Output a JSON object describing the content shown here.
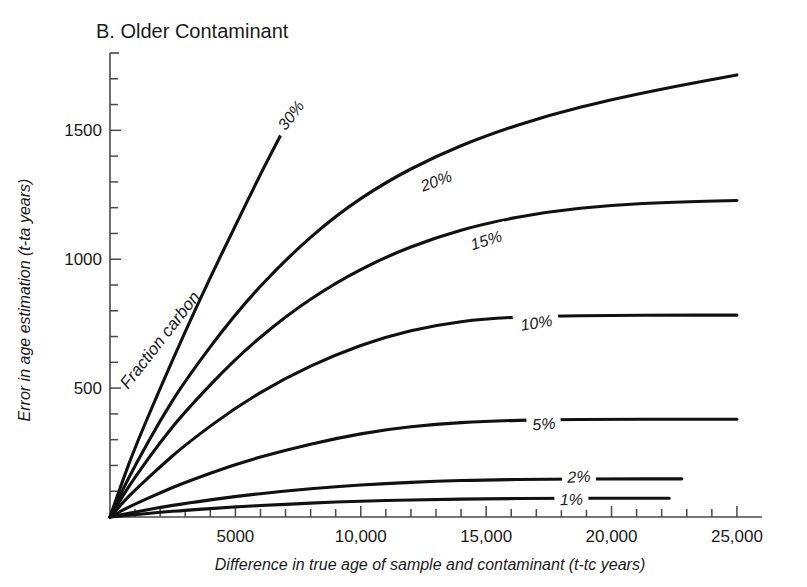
{
  "figure": {
    "panel_label": "B. Older Contaminant",
    "background_color": "#ffffff",
    "curve_color": "#111111",
    "axis_color": "#4a4a4a"
  },
  "chart_data": {
    "type": "line",
    "title": "B. Older Contaminant",
    "xlabel": "Difference in true age of sample and contaminant (t-tc years)",
    "ylabel": "Error in age estimation (t-ta years)",
    "xlim": [
      0,
      26000
    ],
    "ylim": [
      0,
      1800
    ],
    "grid": false,
    "legend": "inline-curve-labels",
    "annotation": "Fraction carbon",
    "x_ticks_major": [
      5000,
      10000,
      15000,
      20000,
      25000
    ],
    "x_tick_labels": [
      "5000",
      "10,000",
      "15,000",
      "20,000",
      "25,000"
    ],
    "x_tick_minor_step": 1000,
    "y_ticks_major": [
      500,
      1000,
      1500
    ],
    "y_tick_labels": [
      "500",
      "1000",
      "1500"
    ],
    "y_tick_minor_step": 100,
    "series": [
      {
        "name": "30%",
        "label": "30%",
        "label_x": 7200,
        "label_y": 1560,
        "label_rotation": -52,
        "x": [
          0,
          500,
          1000,
          2000,
          3000,
          4000,
          5000,
          6000,
          6800
        ],
        "values": [
          0,
          140,
          270,
          500,
          720,
          930,
          1130,
          1330,
          1480
        ]
      },
      {
        "name": "20%",
        "label": "20%",
        "label_x": 13000,
        "label_y": 1305,
        "label_rotation": -20,
        "x": [
          0,
          500,
          1000,
          2000,
          3000,
          5000,
          7000,
          9000,
          11000,
          13000,
          15000,
          17500,
          20000,
          22500,
          25000
        ],
        "values": [
          0,
          105,
          200,
          375,
          530,
          790,
          1000,
          1170,
          1300,
          1400,
          1480,
          1560,
          1620,
          1670,
          1715
        ]
      },
      {
        "name": "15%",
        "label": "15%",
        "label_x": 15000,
        "label_y": 1075,
        "label_rotation": -17,
        "x": [
          0,
          500,
          1000,
          2000,
          3000,
          5000,
          7000,
          9000,
          11000,
          13000,
          15000,
          17500,
          20000,
          22500,
          25000
        ],
        "values": [
          0,
          80,
          155,
          290,
          410,
          615,
          780,
          910,
          1010,
          1085,
          1140,
          1185,
          1210,
          1222,
          1228
        ]
      },
      {
        "name": "10%",
        "label": "10%",
        "label_x": 17000,
        "label_y": 755,
        "label_rotation": -9,
        "x": [
          0,
          500,
          1000,
          2000,
          3000,
          5000,
          7000,
          9000,
          11000,
          13000,
          15000,
          17500,
          20000,
          22500,
          25000
        ],
        "values": [
          0,
          55,
          105,
          195,
          280,
          425,
          540,
          630,
          700,
          745,
          770,
          780,
          782,
          783,
          783
        ]
      },
      {
        "name": "5%",
        "label": "5%",
        "label_x": 17300,
        "label_y": 363,
        "label_rotation": -5,
        "x": [
          0,
          500,
          1000,
          2000,
          3000,
          5000,
          7000,
          9000,
          11000,
          13000,
          15000,
          17500,
          20000,
          22500,
          25000
        ],
        "values": [
          0,
          26,
          50,
          94,
          135,
          205,
          260,
          305,
          340,
          360,
          372,
          378,
          379,
          379,
          379
        ]
      },
      {
        "name": "2%",
        "label": "2%",
        "label_x": 18700,
        "label_y": 158,
        "label_rotation": -2,
        "x": [
          0,
          500,
          1000,
          2000,
          3000,
          5000,
          7000,
          9000,
          11000,
          13000,
          15000,
          17500,
          20000,
          22800
        ],
        "values": [
          0,
          10,
          19,
          37,
          53,
          80,
          101,
          118,
          130,
          139,
          144,
          147,
          148,
          148
        ]
      },
      {
        "name": "1%",
        "label": "1%",
        "label_x": 18400,
        "label_y": 70,
        "label_rotation": -1,
        "x": [
          0,
          500,
          1000,
          2000,
          3000,
          5000,
          7000,
          9000,
          11000,
          13000,
          15000,
          17500,
          20000,
          22300
        ],
        "values": [
          0,
          5,
          9,
          18,
          26,
          39,
          50,
          58,
          64,
          68,
          71,
          72,
          73,
          73
        ]
      }
    ]
  }
}
